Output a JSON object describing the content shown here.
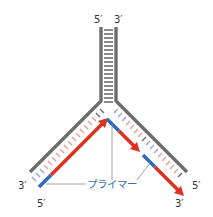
{
  "diagram": {
    "type": "DNA replication fork",
    "colors": {
      "template_strand": "#6e6e6e",
      "base_pair_rungs": "#6e6e6e",
      "new_strand": "#e0301e",
      "primer": "#2f6bbd",
      "primer_label": "#3a6fb5",
      "leader_line": "#8a8a8a"
    },
    "labels": {
      "top_left": "5′",
      "top_right": "3′",
      "left_arm_end": "3′",
      "left_primer_end": "5′",
      "right_arm_end": "5′",
      "right_new_strand_end": "3′",
      "primer": "プライマー"
    }
  }
}
